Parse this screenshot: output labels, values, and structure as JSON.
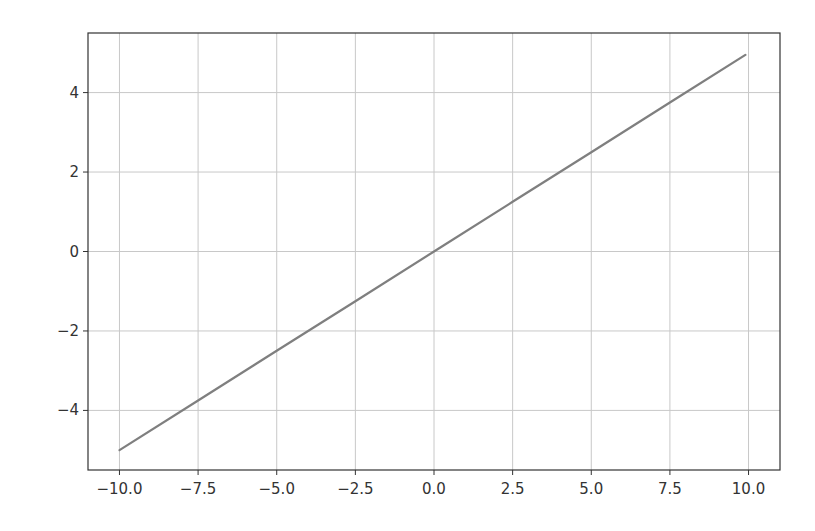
{
  "chart_data": {
    "type": "line",
    "title": "",
    "xlabel": "",
    "ylabel": "",
    "xlim": [
      -11.0,
      11.0
    ],
    "ylim": [
      -5.5,
      5.5
    ],
    "grid": true,
    "legend": null,
    "x_ticks": [
      -10.0,
      -7.5,
      -5.0,
      -2.5,
      0.0,
      2.5,
      5.0,
      7.5,
      10.0
    ],
    "x_tick_labels": [
      "−10.0",
      "−7.5",
      "−5.0",
      "−2.5",
      "0.0",
      "2.5",
      "5.0",
      "7.5",
      "10.0"
    ],
    "y_ticks": [
      -4,
      -2,
      0,
      2,
      4
    ],
    "y_tick_labels": [
      "−4",
      "−2",
      "0",
      "2",
      "4"
    ],
    "series": [
      {
        "name": "y = x/2",
        "color": "#7f7f7f",
        "x": [
          -10.0,
          -7.5,
          -5.0,
          -2.5,
          0.0,
          2.5,
          5.0,
          7.5,
          9.9
        ],
        "y": [
          -5.0,
          -3.75,
          -2.5,
          -1.25,
          0.0,
          1.25,
          2.5,
          3.75,
          4.95
        ]
      }
    ]
  },
  "colors": {
    "line": "#7f7f7f",
    "grid": "#c8c8c8",
    "axes": "#333333",
    "background": "#ffffff"
  }
}
